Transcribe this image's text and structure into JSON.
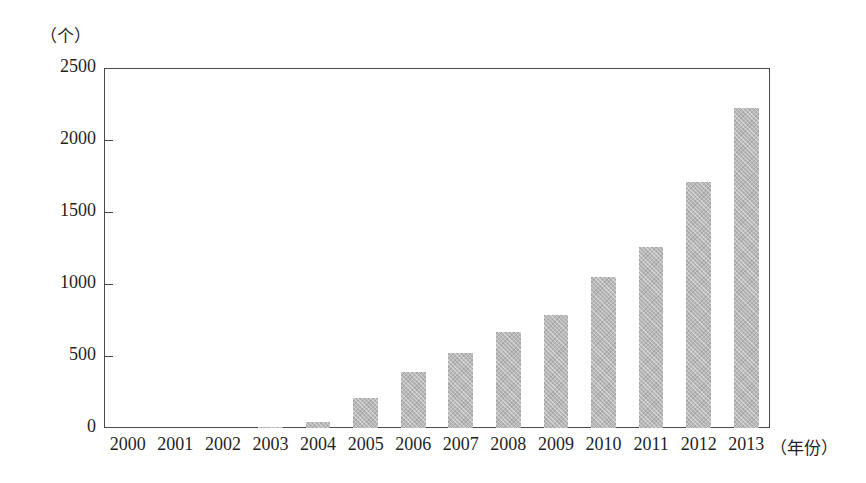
{
  "chart_data": {
    "type": "bar",
    "title": "",
    "subtitle": "",
    "xlabel": "（年份）",
    "ylabel": "（个）",
    "categories": [
      "2000",
      "2001",
      "2002",
      "2003",
      "2004",
      "2005",
      "2006",
      "2007",
      "2008",
      "2009",
      "2010",
      "2011",
      "2012",
      "2013"
    ],
    "values": [
      0,
      0,
      0,
      5,
      40,
      205,
      389,
      521,
      667,
      785,
      1050,
      1256,
      1710,
      2222
    ],
    "ylim": [
      0,
      2500
    ],
    "ytick_labels": [
      "2500",
      "2000",
      "1500",
      "1000",
      "500",
      "0"
    ],
    "ytick_values": [
      2500,
      2000,
      1500,
      1000,
      500,
      0
    ],
    "grid": false,
    "legend": false,
    "legend_position": "none",
    "series": [
      {
        "name": "数量",
        "values": [
          0,
          0,
          0,
          5,
          40,
          205,
          389,
          521,
          667,
          785,
          1050,
          1256,
          1710,
          2222
        ]
      }
    ],
    "bar_color": "#b8b8b8",
    "axis_color": "#4a4a4a",
    "background_color": "#ffffff"
  },
  "axes": {
    "y_unit_caption": "（个）",
    "x_unit_caption": "（年份）"
  }
}
